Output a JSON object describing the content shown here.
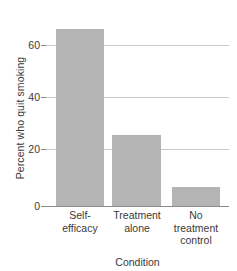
{
  "chart_data": {
    "type": "bar",
    "title": "",
    "categories": [
      "Self-efficacy",
      "Treatment alone",
      "No treatment control"
    ],
    "category_lines": [
      [
        "Self-",
        "efficacy"
      ],
      [
        "Treatment",
        "alone"
      ],
      [
        "No",
        "treatment",
        "control"
      ]
    ],
    "values": [
      65,
      26,
      7
    ],
    "xlabel": "Condition",
    "ylabel": "Percent who quit smoking",
    "ylim": [
      0,
      69
    ],
    "yticks": [
      0,
      20,
      40,
      60
    ],
    "ytick_labels": [
      "0",
      "20",
      "40",
      "60"
    ],
    "grid": "horizontal",
    "legend": "none",
    "bar_color": "#b4b4b4",
    "gridline_color": "#c9c9c9",
    "axis_color": "#8c8c8c",
    "text_color": "#3a3a3a"
  },
  "axes": {
    "y_title": "Percent who quit smoking",
    "x_title": "Condition",
    "ytick_0": "0",
    "ytick_20": "20",
    "ytick_40": "40",
    "ytick_60": "60"
  },
  "bars": [
    {
      "label_line1": "Self-",
      "label_line2": "efficacy",
      "label_line3": "",
      "value": 65
    },
    {
      "label_line1": "Treatment",
      "label_line2": "alone",
      "label_line3": "",
      "value": 26
    },
    {
      "label_line1": "No",
      "label_line2": "treatment",
      "label_line3": "control",
      "value": 7
    }
  ]
}
